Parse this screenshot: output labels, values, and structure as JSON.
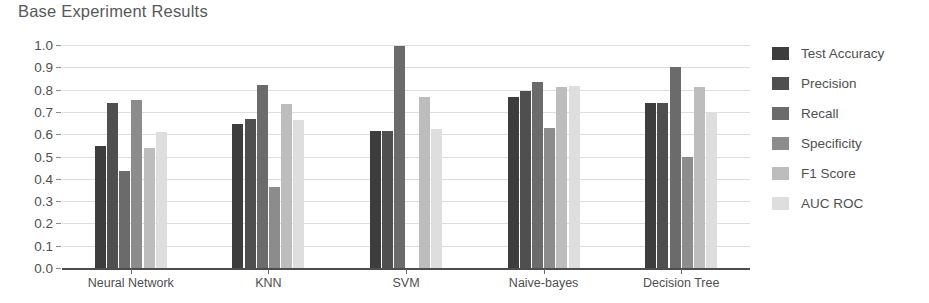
{
  "chart_data": {
    "type": "bar",
    "title": "Base Experiment Results",
    "xlabel": "",
    "ylabel": "",
    "ylim": [
      0.0,
      1.0
    ],
    "grid": true,
    "legend_position": "right",
    "categories": [
      "Neural Network",
      "KNN",
      "SVM",
      "Naive-bayes",
      "Decision Tree"
    ],
    "y_ticks": [
      "0.0",
      "0.1",
      "0.2",
      "0.3",
      "0.4",
      "0.5",
      "0.6",
      "0.7",
      "0.8",
      "0.9",
      "1.0"
    ],
    "y_tick_values": [
      0.0,
      0.1,
      0.2,
      0.3,
      0.4,
      0.5,
      0.6,
      0.7,
      0.8,
      0.9,
      1.0
    ],
    "series": [
      {
        "name": "Test Accuracy",
        "color": "#3d3d3d",
        "values": [
          0.545,
          0.645,
          0.615,
          0.765,
          0.74
        ]
      },
      {
        "name": "Precision",
        "color": "#4f4f4f",
        "values": [
          0.74,
          0.67,
          0.615,
          0.795,
          0.74
        ]
      },
      {
        "name": "Recall",
        "color": "#6b6b6b",
        "values": [
          0.435,
          0.82,
          0.995,
          0.835,
          0.9
        ]
      },
      {
        "name": "Specificity",
        "color": "#8c8c8c",
        "values": [
          0.755,
          0.365,
          0.0,
          0.63,
          0.5
        ]
      },
      {
        "name": "F1 Score",
        "color": "#bdbdbd",
        "values": [
          0.54,
          0.735,
          0.765,
          0.81,
          0.81
        ]
      },
      {
        "name": "AUC ROC",
        "color": "#dedede",
        "values": [
          0.61,
          0.665,
          0.625,
          0.815,
          0.7
        ]
      }
    ]
  },
  "colors": {
    "background": "#ffffff",
    "text": "#4f4f4f",
    "title": "#585858",
    "gridline": "#dedee2",
    "axis": "#4d4d4d"
  }
}
